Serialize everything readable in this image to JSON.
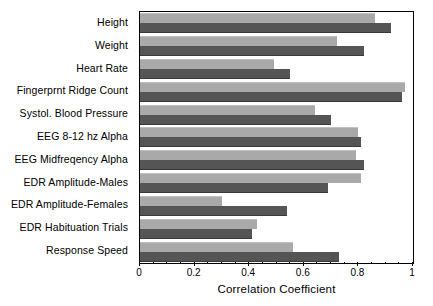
{
  "chart_data": {
    "type": "bar",
    "orientation": "horizontal",
    "title": "",
    "xlabel": "Correlation Coefficient",
    "ylabel": "",
    "xlim": [
      0,
      1
    ],
    "xticks": [
      0,
      0.2,
      0.4,
      0.6,
      0.8,
      1
    ],
    "xtick_labels": [
      "0",
      "0.2",
      "0.4",
      "0.6",
      "0.8",
      "1"
    ],
    "minor_ticks": true,
    "grid": false,
    "legend": "none",
    "categories": [
      "Height",
      "Weight",
      "Heart Rate",
      "Fingerprnt Ridge Count",
      "Systol. Blood Pressure",
      "EEG 8-12 hz Alpha",
      "EEG Midfreqency Alpha",
      "EDR Amplitude-Males",
      "EDR Amplitude-Females",
      "EDR Habituation Trials",
      "Response Speed"
    ],
    "series": [
      {
        "name": "series-light",
        "color": "#a9a9a9",
        "values": [
          0.86,
          0.72,
          0.49,
          0.97,
          0.64,
          0.8,
          0.79,
          0.81,
          0.3,
          0.43,
          0.56
        ]
      },
      {
        "name": "series-dark",
        "color": "#555555",
        "values": [
          0.92,
          0.82,
          0.55,
          0.96,
          0.7,
          0.81,
          0.82,
          0.69,
          0.54,
          0.41,
          0.73
        ]
      }
    ]
  }
}
